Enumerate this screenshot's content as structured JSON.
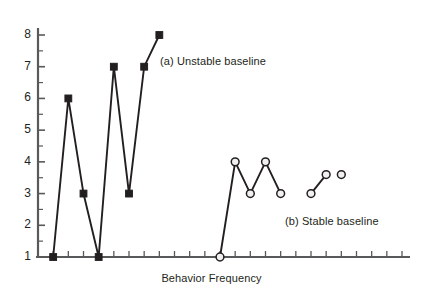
{
  "figure": {
    "background": "#ffffff",
    "ink_color": "#231f20",
    "axis_color": "#58595b"
  },
  "chart_data": {
    "type": "line",
    "title": "",
    "subtitle": "",
    "xlabel": "Behavior Frequency",
    "ylabel": "",
    "xlim": [
      0,
      24
    ],
    "ylim": [
      1,
      8.5
    ],
    "grid": false,
    "legend_position": "inline-annotation",
    "x_tick_labels": [],
    "y_tick_labels": [
      "1",
      "2",
      "3",
      "4",
      "5",
      "6",
      "7",
      "8"
    ],
    "y_ticks": [
      1,
      2,
      3,
      4,
      5,
      6,
      7,
      8
    ],
    "y_minor_ticks": [
      1.5,
      2.5,
      3.5,
      4.5,
      5.5,
      6.5,
      7.5,
      8.25
    ],
    "x_major_tick_count": 24,
    "series": [
      {
        "name": "(a) Unstable baseline",
        "marker": "filled-square",
        "marker_color": "#231f20",
        "line_color": "#231f20",
        "x": [
          1,
          2,
          3,
          4,
          5,
          6,
          7,
          8
        ],
        "values": [
          1,
          6,
          3,
          1,
          7,
          3,
          7,
          8
        ]
      },
      {
        "name": "(b) Stable baseline",
        "marker": "open-circle",
        "marker_color": "#231f20",
        "marker_fill": "#f1f1f1",
        "line_color": "#231f20",
        "x": [
          12,
          13,
          14,
          15,
          16,
          17,
          18,
          19,
          20
        ],
        "values": [
          1,
          4,
          3,
          4,
          3,
          null,
          3,
          3.6,
          3.6
        ],
        "segments": [
          {
            "x": [
              12,
              13,
              14,
              15,
              16
            ],
            "values": [
              1,
              4,
              3,
              4,
              3
            ]
          },
          {
            "x": [
              18,
              19
            ],
            "values": [
              3,
              3.6
            ]
          },
          {
            "x": [
              20
            ],
            "values": [
              3.6
            ]
          }
        ]
      }
    ],
    "annotations": [
      {
        "id": "a",
        "text": "(a) Unstable baseline",
        "x_px": 160,
        "y_px": 55
      },
      {
        "id": "b",
        "text": "(b) Stable baseline",
        "x_px": 285,
        "y_px": 215
      }
    ]
  }
}
